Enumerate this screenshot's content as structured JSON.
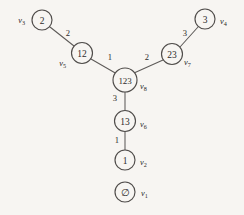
{
  "figure": {
    "name": "subset-lattice-tree-diagram",
    "background_color": "#f7f5f2",
    "ink_color": "#4f4c4a"
  },
  "graph": {
    "type": "undirected-weighted-tree",
    "nodes": [
      {
        "id": "n2",
        "label": "2",
        "vertex": "v",
        "vertex_sub": "3",
        "cx": 42,
        "cy": 20,
        "r": 10,
        "vertex_x": 25,
        "vertex_y": 20,
        "vertex_anchor": "end"
      },
      {
        "id": "n12",
        "label": "12",
        "vertex": "v",
        "vertex_sub": "5",
        "cx": 82,
        "cy": 53,
        "r": 10.5,
        "vertex_x": 66,
        "vertex_y": 63,
        "vertex_anchor": "end"
      },
      {
        "id": "n123",
        "label": "123",
        "vertex": "v",
        "vertex_sub": "8",
        "cx": 125,
        "cy": 80,
        "r": 12,
        "vertex_x": 140,
        "vertex_y": 86,
        "vertex_anchor": "start"
      },
      {
        "id": "n23",
        "label": "23",
        "vertex": "v",
        "vertex_sub": "7",
        "cx": 172,
        "cy": 54,
        "r": 10.5,
        "vertex_x": 184,
        "vertex_y": 62,
        "vertex_anchor": "start"
      },
      {
        "id": "n3",
        "label": "3",
        "vertex": "v",
        "vertex_sub": "4",
        "cx": 205,
        "cy": 19,
        "r": 10,
        "vertex_x": 220,
        "vertex_y": 21,
        "vertex_anchor": "start"
      },
      {
        "id": "n13",
        "label": "13",
        "vertex": "v",
        "vertex_sub": "6",
        "cx": 125,
        "cy": 121,
        "r": 10.5,
        "vertex_x": 140,
        "vertex_y": 124,
        "vertex_anchor": "start"
      },
      {
        "id": "n1",
        "label": "1",
        "vertex": "v",
        "vertex_sub": "2",
        "cx": 125,
        "cy": 160,
        "r": 10,
        "vertex_x": 140,
        "vertex_y": 162,
        "vertex_anchor": "start"
      },
      {
        "id": "n0",
        "label": "∅",
        "vertex": "v",
        "vertex_sub": "1",
        "cx": 125,
        "cy": 192,
        "r": 10,
        "vertex_x": 141,
        "vertex_y": 193,
        "vertex_anchor": "start"
      }
    ],
    "edges": [
      {
        "id": "e-2-12",
        "source": "n2",
        "target": "n12",
        "weight": "2",
        "x1": 50,
        "y1": 27,
        "x2": 74,
        "y2": 46,
        "wx": 68,
        "wy": 33
      },
      {
        "id": "e-12-123",
        "source": "n12",
        "target": "n123",
        "weight": "1",
        "x1": 91,
        "y1": 59,
        "x2": 117,
        "y2": 74,
        "wx": 110,
        "wy": 57
      },
      {
        "id": "e-123-23",
        "source": "n123",
        "target": "n23",
        "weight": "2",
        "x1": 134,
        "y1": 73,
        "x2": 163,
        "y2": 60,
        "wx": 147,
        "wy": 57
      },
      {
        "id": "e-23-3",
        "source": "n23",
        "target": "n3",
        "weight": "3",
        "x1": 180,
        "y1": 47,
        "x2": 198,
        "y2": 27,
        "wx": 185,
        "wy": 33
      },
      {
        "id": "e-123-13",
        "source": "n123",
        "target": "n13",
        "weight": "3",
        "x1": 125,
        "y1": 92,
        "x2": 125,
        "y2": 110,
        "wx": 115,
        "wy": 98
      },
      {
        "id": "e-13-1",
        "source": "n13",
        "target": "n1",
        "weight": "1",
        "x1": 125,
        "y1": 131,
        "x2": 125,
        "y2": 150,
        "wx": 117,
        "wy": 140
      }
    ]
  }
}
